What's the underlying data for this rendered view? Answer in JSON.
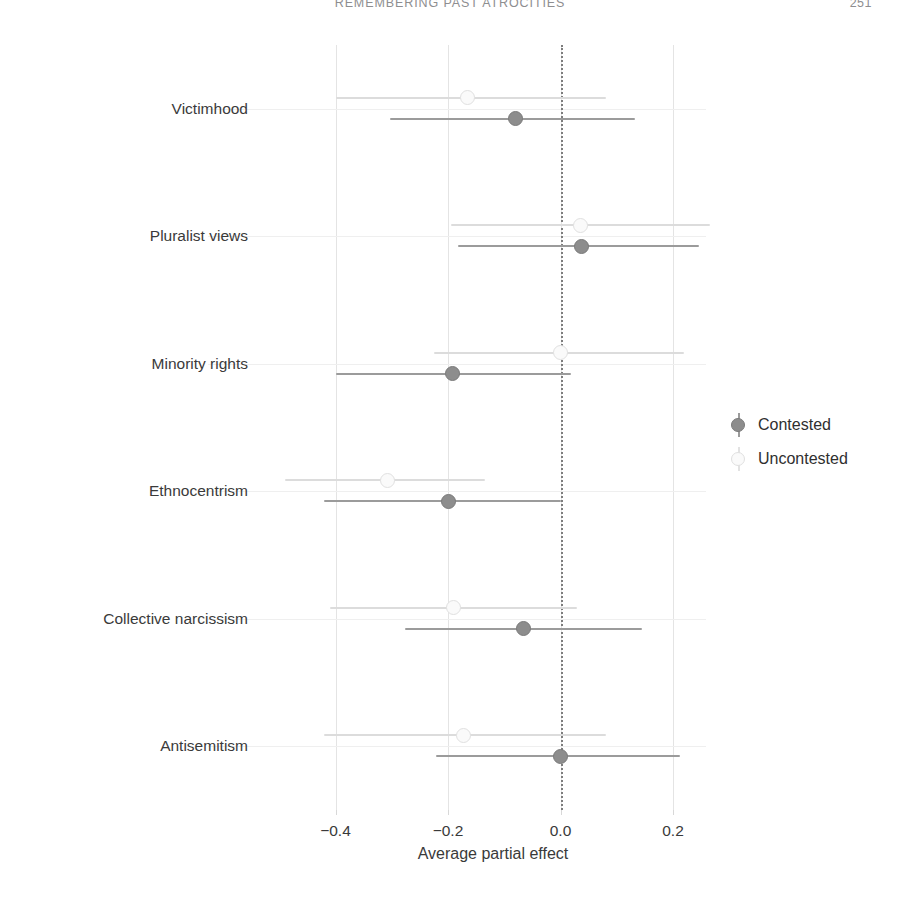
{
  "running_head": {
    "title": "REMEMBERING PAST ATROCITIES",
    "page": "251"
  },
  "legend": {
    "position": "right",
    "items": [
      {
        "label": "Contested",
        "color": "#8d8d8d",
        "key": "contested-marker"
      },
      {
        "label": "Uncontested",
        "color": "#e0e0e0",
        "key": "uncontested-marker"
      }
    ]
  },
  "chart_data": {
    "type": "scatter",
    "title": "",
    "subtitle": "",
    "xlabel": "Average partial effect",
    "ylabel": "",
    "xlim": [
      -0.52,
      0.28
    ],
    "xticks": [
      -0.4,
      -0.2,
      0.0,
      0.2
    ],
    "xticklabels": [
      "−0.4",
      "−0.2",
      "0.0",
      "0.2"
    ],
    "grid": true,
    "zero_reference_line": 0.0,
    "categories": [
      "Victimhood",
      "Pluralist views",
      "Minority rights",
      "Ethnocentrism",
      "Collective narcissism",
      "Antisemitism"
    ],
    "series": [
      {
        "name": "Uncontested",
        "color": "#e0e0e0",
        "values": [
          -0.165,
          0.035,
          0.0,
          -0.307,
          -0.19,
          -0.172
        ],
        "ci_lower": [
          -0.4,
          -0.195,
          -0.225,
          -0.49,
          -0.41,
          -0.42
        ],
        "ci_upper": [
          0.08,
          0.265,
          0.22,
          -0.135,
          0.03,
          0.08
        ]
      },
      {
        "name": "Contested",
        "color": "#8d8d8d",
        "values": [
          -0.08,
          0.037,
          -0.192,
          -0.2,
          -0.065,
          0.0
        ],
        "ci_lower": [
          -0.303,
          -0.183,
          -0.4,
          -0.42,
          -0.277,
          -0.222
        ],
        "ci_upper": [
          0.132,
          0.247,
          0.018,
          0.0,
          0.145,
          0.212
        ]
      }
    ]
  }
}
